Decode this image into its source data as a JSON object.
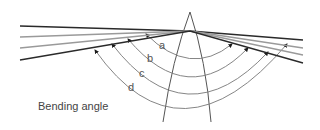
{
  "diagram": {
    "title": "Bending angle",
    "labels": {
      "a": "a",
      "b": "b",
      "c": "c",
      "d": "d"
    },
    "colors": {
      "dark_ray": "#2a2a2a",
      "light_ray": "#9a9a9a",
      "arc": "#777777",
      "prism": "#555555",
      "label": "#555555"
    },
    "rays": [
      {
        "name": "ray-a",
        "shade": "dark"
      },
      {
        "name": "ray-b",
        "shade": "light"
      },
      {
        "name": "ray-c",
        "shade": "light"
      },
      {
        "name": "ray-d",
        "shade": "dark"
      }
    ]
  }
}
